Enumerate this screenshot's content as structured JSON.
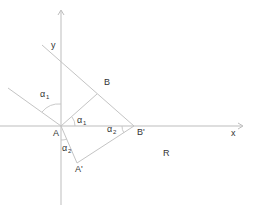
{
  "diagram": {
    "type": "geometry-reflection",
    "axes": {
      "x_label": "x",
      "y_label": "y"
    },
    "points": {
      "A": "A",
      "B": "B",
      "A_prime": "A'",
      "B_prime": "B'",
      "R": "R"
    },
    "angles": {
      "alpha": "α",
      "alpha1_sub": "1",
      "alpha2_sub": "2"
    },
    "colors": {
      "line": "#c4c4c4",
      "axis": "#bdbdbd",
      "text": "#333333",
      "background": "#ffffff"
    }
  }
}
